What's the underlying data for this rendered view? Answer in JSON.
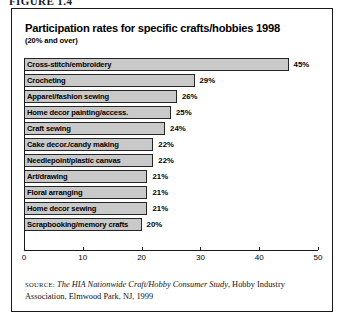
{
  "figure": {
    "caption": "FIGURE 1.4"
  },
  "chart_title": "Participation rates for specific crafts/hobbies 1998",
  "chart_subtitle": "(20% and over)",
  "source": {
    "label": "SOURCE:",
    "title": "The HIA Nationwide Craft/Hobby Consumer Study",
    "rest": ", Hobby Industry Association, Elmwood Park, NJ, 1999"
  },
  "chart_data": {
    "type": "bar",
    "orientation": "horizontal",
    "title": "Participation rates for specific crafts/hobbies 1998",
    "subtitle": "(20% and over)",
    "xlabel": "",
    "ylabel": "",
    "xlim": [
      0,
      50
    ],
    "xticks": [
      0,
      10,
      20,
      30,
      40,
      50
    ],
    "xtick_labels": [
      "0",
      "10",
      "20",
      "30",
      "40",
      "50"
    ],
    "grid": false,
    "legend": false,
    "value_suffix": "%",
    "bar_color": "#c9c9c9",
    "bar_edge_color": "#262626",
    "categories": [
      "Cross-stitch/embroidery",
      "Crocheting",
      "Apparel/fashion sewing",
      "Home decor painting/access.",
      "Craft sewing",
      "Cake decor./candy making",
      "Needlepoint/plastic canvas",
      "Art/drawing",
      "Floral arranging",
      "Home decor sewing",
      "Scrapbooking/memory crafts"
    ],
    "values": [
      45,
      29,
      26,
      25,
      24,
      22,
      22,
      21,
      21,
      21,
      20
    ],
    "value_labels": [
      "45%",
      "29%",
      "26%",
      "25%",
      "24%",
      "22%",
      "22%",
      "21%",
      "21%",
      "21%",
      "20%"
    ]
  }
}
